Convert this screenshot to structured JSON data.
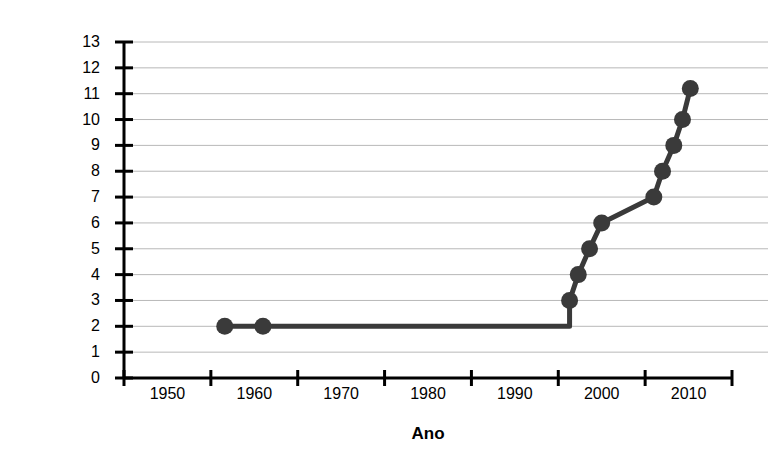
{
  "chart_data": {
    "type": "line",
    "title": "",
    "subtitle": "",
    "xlabel": "Ano",
    "ylabel": "Quantidade de drogas para diabetes",
    "xlim": [
      1945,
      2015
    ],
    "ylim": [
      0,
      13
    ],
    "grid": true,
    "grid_axis": "y",
    "legend": "none",
    "marker": "filled-circle",
    "series_color": "#3a3a3a",
    "grid_color": "#b8b8b8",
    "axis_color": "#000000",
    "xticks": [
      1945,
      1955,
      1965,
      1975,
      1985,
      1995,
      2005,
      2015
    ],
    "xtick_labels": [
      "1950",
      "1960",
      "1970",
      "1980",
      "1990",
      "2000",
      "2010"
    ],
    "xtick_label_values": [
      1950,
      1960,
      1970,
      1980,
      1990,
      2000,
      2010
    ],
    "yticks": [
      0,
      1,
      2,
      3,
      4,
      5,
      6,
      7,
      8,
      9,
      10,
      11,
      12,
      13
    ],
    "ytick_labels": [
      "0",
      "1",
      "2",
      "3",
      "4",
      "5",
      "6",
      "7",
      "8",
      "9",
      "10",
      "11",
      "12",
      "13"
    ],
    "series": [
      {
        "name": "Quantidade de drogas para diabetes",
        "x": [
          1956.6,
          1961,
          1996.3,
          1997.3,
          1998.6,
          2000.0,
          2006.0,
          2007.0,
          2008.3,
          2009.3,
          2010.2
        ],
        "y": [
          2,
          2,
          3,
          4,
          5,
          6,
          7,
          8,
          9,
          10,
          11.2
        ]
      }
    ],
    "line_path_x": [
      1956.6,
      1961,
      1996.3,
      1996.3,
      1997.3,
      1998.6,
      2000.0,
      2006.0,
      2007.0,
      2008.3,
      2009.3,
      2010.2
    ],
    "line_path_y": [
      2,
      2,
      2,
      3,
      4,
      5,
      6,
      7,
      8,
      9,
      10,
      11.2
    ]
  }
}
